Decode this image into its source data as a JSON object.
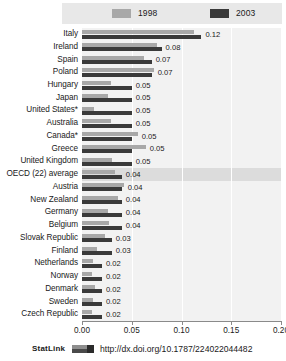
{
  "chart_data": {
    "type": "bar",
    "orientation": "horizontal",
    "title": "",
    "xlabel": "",
    "ylabel": "",
    "xlim": [
      0.0,
      0.2
    ],
    "xticks": [
      "0.00",
      "0.05",
      "0.10",
      "0.15",
      "0.20"
    ],
    "xtick_values": [
      0.0,
      0.05,
      0.1,
      0.15,
      0.2
    ],
    "grid": "vertical-white-gridlines",
    "legend_position": "top",
    "categories": [
      "Italy",
      "Ireland",
      "Spain",
      "Poland",
      "Hungary",
      "Japan",
      "United States*",
      "Australia",
      "Canada*",
      "Greece",
      "United Kingdom",
      "OECD (22) average",
      "Austria",
      "New Zealand",
      "Germany",
      "Belgium",
      "Slovak Republic",
      "Finland",
      "Netherlands",
      "Norway",
      "Denmark",
      "Sweden",
      "Czech Republic"
    ],
    "series": [
      {
        "name": "1998",
        "color": "#a8a8a8",
        "values": [
          0.113,
          0.075,
          0.062,
          0.072,
          0.029,
          0.026,
          0.012,
          0.029,
          0.056,
          0.064,
          0.03,
          0.033,
          0.042,
          0.036,
          0.026,
          0.027,
          0.023,
          0.015,
          0.011,
          0.01,
          0.013,
          0.011,
          0.01
        ]
      },
      {
        "name": "2003",
        "color": "#3a3a3a",
        "values": [
          0.12,
          0.08,
          0.07,
          0.07,
          0.05,
          0.05,
          0.05,
          0.05,
          0.05,
          0.05,
          0.05,
          0.04,
          0.04,
          0.04,
          0.04,
          0.04,
          0.03,
          0.03,
          0.02,
          0.02,
          0.02,
          0.02,
          0.02
        ]
      }
    ],
    "data_labels": [
      "0.12",
      "0.08",
      "0.07",
      "0.07",
      "0.05",
      "0.05",
      "0.05",
      "0.05",
      "0.05",
      "0.05",
      "0.05",
      "0.04",
      "0.04",
      "0.04",
      "0.04",
      "0.04",
      "0.03",
      "0.03",
      "0.02",
      "0.02",
      "0.02",
      "0.02",
      "0.02"
    ],
    "highlighted_category": "OECD (22) average"
  },
  "legend": {
    "items": [
      {
        "label": "1998",
        "color": "#a8a8a8"
      },
      {
        "label": "2003",
        "color": "#3a3a3a"
      }
    ]
  },
  "footer": {
    "statlink_label": "StatLink",
    "url": "http://dx.doi.org/10.1787/224022044482"
  }
}
